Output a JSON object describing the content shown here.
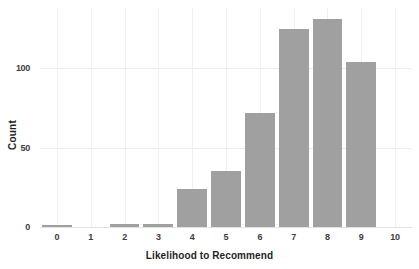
{
  "chart_data": {
    "type": "bar",
    "title": "",
    "xlabel": "Likelihood to Recommend",
    "ylabel": "Count",
    "categories": [
      "0",
      "1",
      "2",
      "3",
      "4",
      "5",
      "6",
      "7",
      "8",
      "9",
      "10"
    ],
    "values": [
      1,
      0,
      2,
      2,
      24,
      35,
      72,
      125,
      131,
      104,
      0
    ],
    "series": [
      {
        "name": "Count",
        "values": [
          1,
          0,
          2,
          2,
          24,
          35,
          72,
          125,
          131,
          104,
          0
        ]
      }
    ],
    "ylim": [
      0,
      138
    ],
    "yticks": [
      0,
      50,
      100
    ],
    "ytick_labels": [
      "0",
      "50",
      "100"
    ],
    "xtick_labels": [
      "0",
      "1",
      "2",
      "3",
      "4",
      "5",
      "6",
      "7",
      "8",
      "9",
      "10"
    ],
    "grid": "horizontal-and-vertical",
    "legend": "none",
    "bar_color": "#a0a0a0",
    "grid_color": "#ececec",
    "background_color": "#ffffff",
    "text_color": "#1f1f1f"
  },
  "axes": {
    "y": {
      "label": "Count",
      "ticks": [
        {
          "value": 0,
          "label": "0"
        },
        {
          "value": 50,
          "label": "50"
        },
        {
          "value": 100,
          "label": "100"
        }
      ]
    },
    "x": {
      "label": "Likelihood to Recommend",
      "ticks": [
        {
          "value": 0,
          "label": "0"
        },
        {
          "value": 1,
          "label": "1"
        },
        {
          "value": 2,
          "label": "2"
        },
        {
          "value": 3,
          "label": "3"
        },
        {
          "value": 4,
          "label": "4"
        },
        {
          "value": 5,
          "label": "5"
        },
        {
          "value": 6,
          "label": "6"
        },
        {
          "value": 7,
          "label": "7"
        },
        {
          "value": 8,
          "label": "8"
        },
        {
          "value": 9,
          "label": "9"
        },
        {
          "value": 10,
          "label": "10"
        }
      ]
    }
  }
}
